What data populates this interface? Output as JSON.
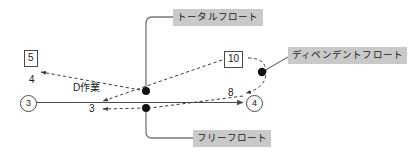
{
  "diagram": {
    "callouts": {
      "total_float": "トータルフロート",
      "dependent_float": "ディペンデントフロート",
      "free_float": "フリーフロート"
    },
    "boxed_numbers": {
      "left": "5",
      "right": "10"
    },
    "event_nodes": {
      "start": "3",
      "end": "4"
    },
    "plain_numbers": {
      "left_four": "4",
      "mid_three": "3",
      "right_eight": "8"
    },
    "activity_label": "D作業",
    "colors": {
      "callout_background": "#c9c9c9",
      "line": "#4a4a4a",
      "dashed_line": "#5a5a5a",
      "dot": "#111111",
      "text": "#1a1a1a",
      "page_background": "#ffffff"
    }
  }
}
